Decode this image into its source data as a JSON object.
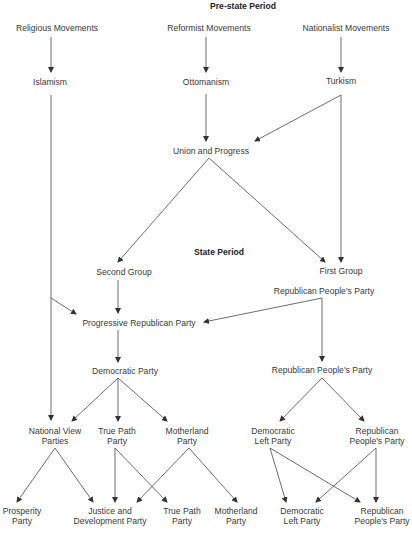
{
  "headers": {
    "pre_state": "Pre-state Period",
    "state": "State Period"
  },
  "nodes": {
    "religious": "Religious Movements",
    "reformist": "Reformist Movements",
    "nationalist": "Nationalist Movements",
    "islamism": "Islamism",
    "ottomanism": "Ottomanism",
    "turkism": "Turkism",
    "union_progress": "Union and Progress",
    "second_group": "Second Group",
    "first_group": "First Group",
    "rpp_1": "Republican People's Party",
    "progressive_rp": "Progressive Republican Party",
    "democratic_party": "Democratic Party",
    "rpp_2": "Republican People's Party",
    "national_view": [
      "National View",
      "Parties"
    ],
    "true_path_1": [
      "True Path",
      "Party"
    ],
    "motherland_1": [
      "Motherland",
      "Party"
    ],
    "democratic_left_1": [
      "Democratic",
      "Left Party"
    ],
    "rpp_3": [
      "Republican",
      "People's Party"
    ],
    "prosperity": [
      "Prosperity",
      "Party"
    ],
    "justice_dev": [
      "Justice and",
      "Development Party"
    ],
    "true_path_2": [
      "True Path",
      "Party"
    ],
    "motherland_2": [
      "Motherland",
      "Party"
    ],
    "democratic_left_2": [
      "Democratic",
      "Left  Party"
    ],
    "rpp_4": [
      "Republican",
      "People's Party"
    ]
  },
  "colors": {
    "line": "#4a4a4a",
    "text": "#3a3a3a",
    "background": "#ffffff"
  }
}
